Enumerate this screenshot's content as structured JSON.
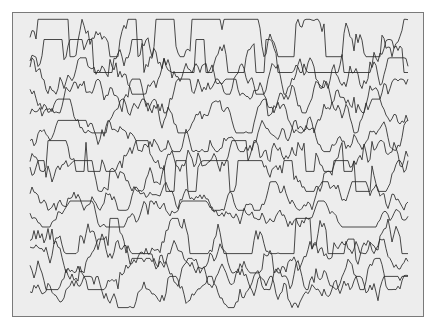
{
  "chart_data": {
    "type": "line",
    "title": "",
    "xlabel": "",
    "ylabel": "",
    "grid": false,
    "legend": "none",
    "channel_count": 14,
    "x_range_px": [
      30,
      408
    ],
    "samples_per_channel": 190,
    "channels": [
      {
        "index": 1,
        "baseline_y": 38,
        "amplitude": 17,
        "clipped": true,
        "seed": 11
      },
      {
        "index": 2,
        "baseline_y": 56,
        "amplitude": 15,
        "clipped": true,
        "seed": 23
      },
      {
        "index": 3,
        "baseline_y": 76,
        "amplitude": 14,
        "clipped": false,
        "seed": 37
      },
      {
        "index": 4,
        "baseline_y": 96,
        "amplitude": 13,
        "clipped": false,
        "seed": 41
      },
      {
        "index": 5,
        "baseline_y": 116,
        "amplitude": 13,
        "clipped": false,
        "seed": 53
      },
      {
        "index": 6,
        "baseline_y": 136,
        "amplitude": 12,
        "clipped": false,
        "seed": 67
      },
      {
        "index": 7,
        "baseline_y": 156,
        "amplitude": 14,
        "clipped": true,
        "seed": 71
      },
      {
        "index": 8,
        "baseline_y": 176,
        "amplitude": 14,
        "clipped": true,
        "seed": 83
      },
      {
        "index": 9,
        "baseline_y": 196,
        "amplitude": 11,
        "clipped": false,
        "seed": 97
      },
      {
        "index": 10,
        "baseline_y": 214,
        "amplitude": 10,
        "clipped": false,
        "seed": 101
      },
      {
        "index": 11,
        "baseline_y": 236,
        "amplitude": 16,
        "clipped": true,
        "seed": 113
      },
      {
        "index": 12,
        "baseline_y": 256,
        "amplitude": 13,
        "clipped": false,
        "seed": 127
      },
      {
        "index": 13,
        "baseline_y": 274,
        "amplitude": 12,
        "clipped": false,
        "seed": 131
      },
      {
        "index": 14,
        "baseline_y": 292,
        "amplitude": 12,
        "clipped": false,
        "seed": 149
      }
    ]
  },
  "colors": {
    "page_background": "#ffffff",
    "frame_background": "#ededed",
    "frame_border": "#7a7a7a",
    "trace_stroke": "#2b2b2b"
  }
}
